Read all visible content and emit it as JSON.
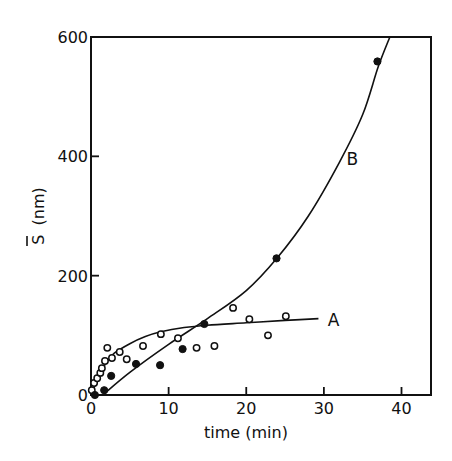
{
  "chart_data": {
    "type": "scatter",
    "title": "",
    "xlabel": "time (min)",
    "ylabel": "S̄ (nm)",
    "xlim": [
      0,
      43.8
    ],
    "ylim": [
      0,
      600
    ],
    "grid": false,
    "x_ticks": [
      0,
      10,
      20,
      30,
      40
    ],
    "y_ticks": [
      0,
      200,
      400,
      600
    ],
    "x_tick_labels": [
      "0",
      "10",
      "20",
      "30",
      "40"
    ],
    "y_tick_labels": [
      "0",
      "200",
      "400",
      "600"
    ],
    "series": [
      {
        "name": "A",
        "marker": "open-circle",
        "points": [
          [
            0.1,
            8
          ],
          [
            0.4,
            20
          ],
          [
            0.8,
            28
          ],
          [
            1.2,
            37
          ],
          [
            1.4,
            45
          ],
          [
            1.8,
            57
          ],
          [
            2.1,
            79
          ],
          [
            2.7,
            62
          ],
          [
            3.7,
            72
          ],
          [
            4.6,
            60
          ],
          [
            6.7,
            82
          ],
          [
            9.0,
            102
          ],
          [
            11.2,
            95
          ],
          [
            13.6,
            79
          ],
          [
            15.9,
            82
          ],
          [
            18.3,
            146
          ],
          [
            20.4,
            127
          ],
          [
            22.8,
            100
          ],
          [
            25.1,
            132
          ]
        ],
        "fit_curve": [
          [
            0,
            0
          ],
          [
            1,
            30
          ],
          [
            2,
            55
          ],
          [
            3,
            70
          ],
          [
            5,
            86
          ],
          [
            7,
            98
          ],
          [
            9,
            106
          ],
          [
            12,
            113
          ],
          [
            15,
            117
          ],
          [
            20,
            121
          ],
          [
            25,
            125
          ],
          [
            29.3,
            128
          ]
        ]
      },
      {
        "name": "B",
        "marker": "filled-circle",
        "points": [
          [
            0.5,
            0
          ],
          [
            1.7,
            8
          ],
          [
            2.6,
            32
          ],
          [
            5.8,
            52
          ],
          [
            8.9,
            50
          ],
          [
            11.8,
            77
          ],
          [
            14.6,
            119
          ],
          [
            23.9,
            229
          ],
          [
            36.9,
            559
          ]
        ],
        "fit_curve": [
          [
            1.5,
            0
          ],
          [
            5,
            38
          ],
          [
            10,
            85
          ],
          [
            15,
            128
          ],
          [
            20,
            175
          ],
          [
            24,
            230
          ],
          [
            28,
            300
          ],
          [
            32,
            390
          ],
          [
            35,
            470
          ],
          [
            37,
            550
          ],
          [
            38.5,
            600
          ]
        ]
      }
    ],
    "annotations": [
      {
        "text": "A",
        "x": 30.5,
        "y": 125
      },
      {
        "text": "B",
        "x": 32.9,
        "y": 395
      }
    ]
  },
  "labels": {
    "xlabel": "time (min)",
    "ylabel_symbol": "S",
    "ylabel_unit": "(nm)",
    "curve_a": "A",
    "curve_b": "B"
  },
  "colors": {
    "ink": "#111111",
    "background": "#ffffff"
  }
}
